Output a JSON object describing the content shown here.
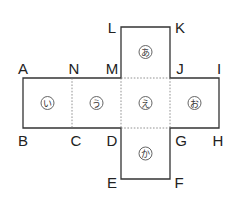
{
  "diagram": {
    "type": "cube-net",
    "vertex_labels": [
      "A",
      "B",
      "C",
      "D",
      "E",
      "F",
      "G",
      "H",
      "I",
      "J",
      "K",
      "L",
      "M",
      "N"
    ],
    "faces": [
      {
        "id": "top",
        "label": "あ"
      },
      {
        "id": "left-end",
        "label": "い"
      },
      {
        "id": "left-mid",
        "label": "う"
      },
      {
        "id": "center",
        "label": "え"
      },
      {
        "id": "right",
        "label": "お"
      },
      {
        "id": "bottom",
        "label": "か"
      }
    ],
    "colors": {
      "line": "#333333",
      "fold_line": "#777777",
      "text": "#222222"
    }
  }
}
